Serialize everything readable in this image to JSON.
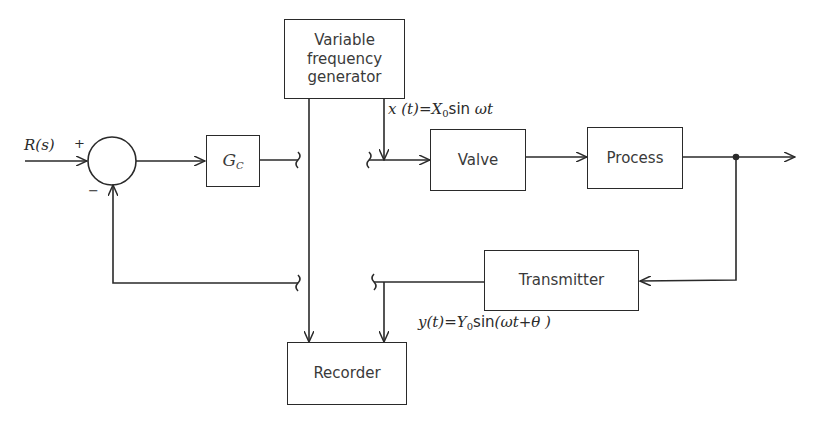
{
  "diagram": {
    "type": "control-loop-frequency-response-test",
    "blocks": {
      "controller": {
        "label_main": "G",
        "label_sub": "C"
      },
      "generator": {
        "label": "Variable\nfrequency\ngenerator",
        "lines": [
          "Variable",
          "frequency",
          "generator"
        ]
      },
      "valve": {
        "label": "Valve"
      },
      "process": {
        "label": "Process"
      },
      "transmitter": {
        "label": "Transmitter"
      },
      "recorder": {
        "label": "Recorder"
      }
    },
    "summing_junction": {
      "plus_sign": "+",
      "minus_sign": "−"
    },
    "signals": {
      "input": "R(s)",
      "x_signal": {
        "lhs": "x (t)=",
        "amp": "X",
        "amp_sub": "0",
        "func": "sin ",
        "arg": "ωt"
      },
      "y_signal": {
        "lhs": "y(t)=",
        "amp": "Y",
        "amp_sub": "0",
        "func": "sin",
        "arg": "(ωt+θ )"
      }
    },
    "notes": [
      "Loop opened between G_C and Valve; feedback opened between Transmitter and summing junction (break symbols)"
    ]
  },
  "colors": {
    "line": "#2a2a2a",
    "text": "#3a3a3a",
    "background": "#ffffff"
  }
}
